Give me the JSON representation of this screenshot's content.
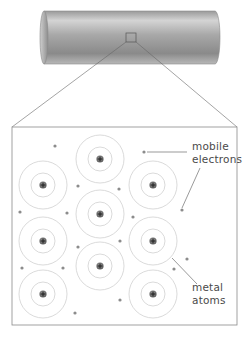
{
  "diagram": {
    "labels": {
      "mobile_electrons": [
        "mobile",
        "electrons"
      ],
      "metal_atoms": [
        "metal",
        "atoms"
      ]
    },
    "colors": {
      "outline": "#777777",
      "ring": "#d6d6d6",
      "electron": "#8c8c8c",
      "nucleus": "#6a6a6a",
      "text": "#4a4a4a"
    },
    "atom_symbol": "+",
    "atoms": [
      {
        "x": 43,
        "y": 185
      },
      {
        "x": 43,
        "y": 241
      },
      {
        "x": 43,
        "y": 294
      },
      {
        "x": 100,
        "y": 159
      },
      {
        "x": 100,
        "y": 214
      },
      {
        "x": 100,
        "y": 266
      },
      {
        "x": 153,
        "y": 185
      },
      {
        "x": 153,
        "y": 241
      },
      {
        "x": 153,
        "y": 294
      }
    ],
    "electrons": [
      {
        "x": 55,
        "y": 146
      },
      {
        "x": 144,
        "y": 152
      },
      {
        "x": 78,
        "y": 186
      },
      {
        "x": 119,
        "y": 189
      },
      {
        "x": 20,
        "y": 212
      },
      {
        "x": 67,
        "y": 213
      },
      {
        "x": 133,
        "y": 217
      },
      {
        "x": 182,
        "y": 210
      },
      {
        "x": 78,
        "y": 247
      },
      {
        "x": 120,
        "y": 241
      },
      {
        "x": 22,
        "y": 268
      },
      {
        "x": 63,
        "y": 268
      },
      {
        "x": 187,
        "y": 259
      },
      {
        "x": 174,
        "y": 269
      },
      {
        "x": 120,
        "y": 300
      },
      {
        "x": 75,
        "y": 313
      }
    ]
  }
}
